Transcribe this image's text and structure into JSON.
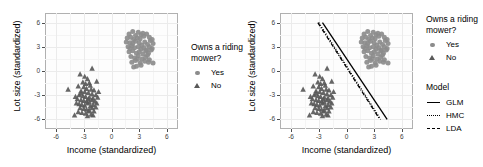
{
  "figure": {
    "panels": [
      {
        "id": "left",
        "has_model_lines": false
      },
      {
        "id": "right",
        "has_model_lines": true
      }
    ],
    "axis": {
      "xlabel": "Income (standardized)",
      "ylabel": "Lot size (standardized)",
      "xticks": [
        "-6",
        "-3",
        "0",
        "3",
        "6"
      ],
      "yticks": [
        "6",
        "3",
        "0",
        "-3",
        "-6"
      ],
      "xlim": [
        -7.2,
        7.2
      ],
      "ylim": [
        -7.2,
        7.2
      ]
    },
    "legend_points": {
      "title": "Owns a riding mower?",
      "items": [
        {
          "label": "Yes",
          "marker": "circle",
          "color": "#8c8c8c"
        },
        {
          "label": "No",
          "marker": "triangle",
          "color": "#595959"
        }
      ]
    },
    "legend_model": {
      "title": "Model",
      "items": [
        {
          "label": "GLM",
          "linestyle": "solid",
          "color": "#000000"
        },
        {
          "label": "HMC",
          "linestyle": "dotted",
          "color": "#000000"
        },
        {
          "label": "LDA",
          "linestyle": "dashed",
          "color": "#000000"
        }
      ]
    }
  },
  "chart_data": {
    "type": "scatter",
    "title": "",
    "xlabel": "Income (standardized)",
    "ylabel": "Lot size (standardized)",
    "xlim": [
      -7.2,
      7.2
    ],
    "ylim": [
      -7.2,
      7.2
    ],
    "xticks": [
      -6,
      -3,
      0,
      3,
      6
    ],
    "yticks": [
      -6,
      -3,
      0,
      3,
      6
    ],
    "grid": true,
    "legend_position": "right",
    "series": [
      {
        "name": "Yes",
        "marker": "circle",
        "color": "#8c8c8c",
        "points": [
          [
            1.9,
            4.6
          ],
          [
            2.3,
            4.9
          ],
          [
            2.6,
            4.4
          ],
          [
            2.9,
            4.8
          ],
          [
            3.2,
            4.5
          ],
          [
            1.7,
            4.1
          ],
          [
            2.1,
            4.2
          ],
          [
            2.4,
            3.9
          ],
          [
            2.8,
            4.1
          ],
          [
            3.1,
            4.0
          ],
          [
            3.5,
            4.3
          ],
          [
            3.8,
            4.6
          ],
          [
            4.1,
            4.2
          ],
          [
            1.6,
            3.6
          ],
          [
            2.0,
            3.5
          ],
          [
            2.3,
            3.4
          ],
          [
            2.6,
            3.7
          ],
          [
            3.0,
            3.5
          ],
          [
            3.3,
            3.2
          ],
          [
            3.6,
            3.6
          ],
          [
            3.9,
            3.3
          ],
          [
            4.2,
            3.8
          ],
          [
            4.5,
            3.4
          ],
          [
            1.8,
            3.0
          ],
          [
            2.2,
            3.1
          ],
          [
            2.5,
            2.9
          ],
          [
            2.9,
            3.0
          ],
          [
            3.2,
            2.7
          ],
          [
            3.5,
            2.9
          ],
          [
            3.8,
            2.6
          ],
          [
            4.1,
            3.0
          ],
          [
            4.4,
            2.8
          ],
          [
            1.9,
            2.4
          ],
          [
            2.3,
            2.5
          ],
          [
            2.7,
            2.2
          ],
          [
            3.0,
            2.4
          ],
          [
            3.4,
            2.1
          ],
          [
            3.7,
            2.5
          ],
          [
            4.0,
            2.2
          ],
          [
            4.3,
            2.6
          ],
          [
            2.1,
            1.8
          ],
          [
            2.5,
            1.6
          ],
          [
            2.9,
            1.9
          ],
          [
            3.3,
            1.5
          ],
          [
            3.7,
            1.7
          ],
          [
            4.1,
            1.4
          ],
          [
            2.2,
            1.1
          ],
          [
            2.6,
            1.3
          ],
          [
            3.1,
            1.0
          ],
          [
            3.6,
            1.2
          ],
          [
            4.0,
            1.1
          ],
          [
            4.5,
            1.0
          ],
          [
            2.7,
            0.6
          ],
          [
            3.2,
            0.7
          ],
          [
            2.4,
            0.5
          ],
          [
            3.9,
            2.0
          ],
          [
            2.0,
            2.8
          ],
          [
            3.4,
            4.7
          ],
          [
            2.8,
            1.5
          ],
          [
            4.4,
            3.9
          ]
        ]
      },
      {
        "name": "No",
        "marker": "triangle",
        "color": "#595959",
        "points": [
          [
            -2.1,
            0.3
          ],
          [
            -1.6,
            -1.3
          ],
          [
            -3.4,
            -0.4
          ],
          [
            -2.9,
            -0.7
          ],
          [
            -2.6,
            -1.0
          ],
          [
            -3.1,
            -1.4
          ],
          [
            -2.4,
            -1.5
          ],
          [
            -4.7,
            -2.3
          ],
          [
            -3.6,
            -1.9
          ],
          [
            -3.0,
            -2.0
          ],
          [
            -2.7,
            -2.2
          ],
          [
            -2.3,
            -1.8
          ],
          [
            -1.9,
            -2.4
          ],
          [
            -3.3,
            -2.5
          ],
          [
            -2.9,
            -2.6
          ],
          [
            -2.5,
            -2.7
          ],
          [
            -2.1,
            -2.9
          ],
          [
            -3.5,
            -3.0
          ],
          [
            -3.1,
            -3.1
          ],
          [
            -2.8,
            -3.2
          ],
          [
            -2.4,
            -3.3
          ],
          [
            -2.0,
            -3.4
          ],
          [
            -1.7,
            -3.0
          ],
          [
            -3.7,
            -3.5
          ],
          [
            -3.3,
            -3.6
          ],
          [
            -3.0,
            -3.7
          ],
          [
            -2.7,
            -3.8
          ],
          [
            -2.4,
            -3.9
          ],
          [
            -2.1,
            -3.6
          ],
          [
            -1.8,
            -3.8
          ],
          [
            -1.5,
            -3.3
          ],
          [
            -3.5,
            -4.1
          ],
          [
            -3.2,
            -4.2
          ],
          [
            -2.9,
            -4.3
          ],
          [
            -2.6,
            -4.0
          ],
          [
            -2.3,
            -4.4
          ],
          [
            -2.0,
            -4.2
          ],
          [
            -1.7,
            -4.5
          ],
          [
            -3.8,
            -4.0
          ],
          [
            -3.4,
            -4.6
          ],
          [
            -3.0,
            -4.7
          ],
          [
            -2.7,
            -4.8
          ],
          [
            -2.4,
            -4.9
          ],
          [
            -2.1,
            -4.6
          ],
          [
            -1.9,
            -5.0
          ],
          [
            -3.6,
            -5.1
          ],
          [
            -3.2,
            -5.2
          ],
          [
            -2.8,
            -5.3
          ],
          [
            -2.5,
            -5.0
          ],
          [
            -2.2,
            -5.4
          ],
          [
            -4.0,
            -5.5
          ],
          [
            -2.6,
            -5.6
          ],
          [
            -2.0,
            -5.5
          ],
          [
            -1.4,
            -2.6
          ],
          [
            -3.9,
            -3.2
          ],
          [
            -2.2,
            -2.3
          ],
          [
            -2.8,
            -1.6
          ],
          [
            -3.3,
            -2.8
          ],
          [
            -1.6,
            -4.0
          ],
          [
            -2.5,
            -3.5
          ]
        ]
      }
    ],
    "lines": [
      {
        "name": "GLM",
        "linestyle": "solid",
        "color": "#000000",
        "x": [
          -2.6,
          4.4
        ],
        "y": [
          6.0,
          -6.0
        ]
      },
      {
        "name": "HMC",
        "linestyle": "dotted",
        "color": "#000000",
        "x": [
          -3.0,
          3.7
        ],
        "y": [
          6.0,
          -6.0
        ]
      },
      {
        "name": "LDA",
        "linestyle": "dashed",
        "color": "#000000",
        "x": [
          -3.1,
          3.6
        ],
        "y": [
          6.0,
          -6.0
        ]
      }
    ]
  }
}
